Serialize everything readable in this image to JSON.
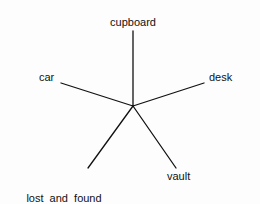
{
  "diagram": {
    "type": "radial-spokes",
    "center": {
      "x": 133,
      "y": 106
    },
    "colors": {
      "line": "#111111",
      "text": "#111111",
      "background": "#ffffff"
    },
    "spokes": [
      {
        "id": "cupboard",
        "label": "cupboard",
        "end": {
          "x": 133,
          "y": 31
        }
      },
      {
        "id": "car",
        "label": "car",
        "end": {
          "x": 61,
          "y": 83
        }
      },
      {
        "id": "desk",
        "label": "desk",
        "end": {
          "x": 204,
          "y": 83
        }
      },
      {
        "id": "lost-and-found",
        "label_line1": "lost  and  found",
        "label_line2": "department",
        "end": {
          "x": 88,
          "y": 168
        }
      },
      {
        "id": "vault",
        "label": "vault",
        "end": {
          "x": 176,
          "y": 168
        }
      }
    ]
  }
}
